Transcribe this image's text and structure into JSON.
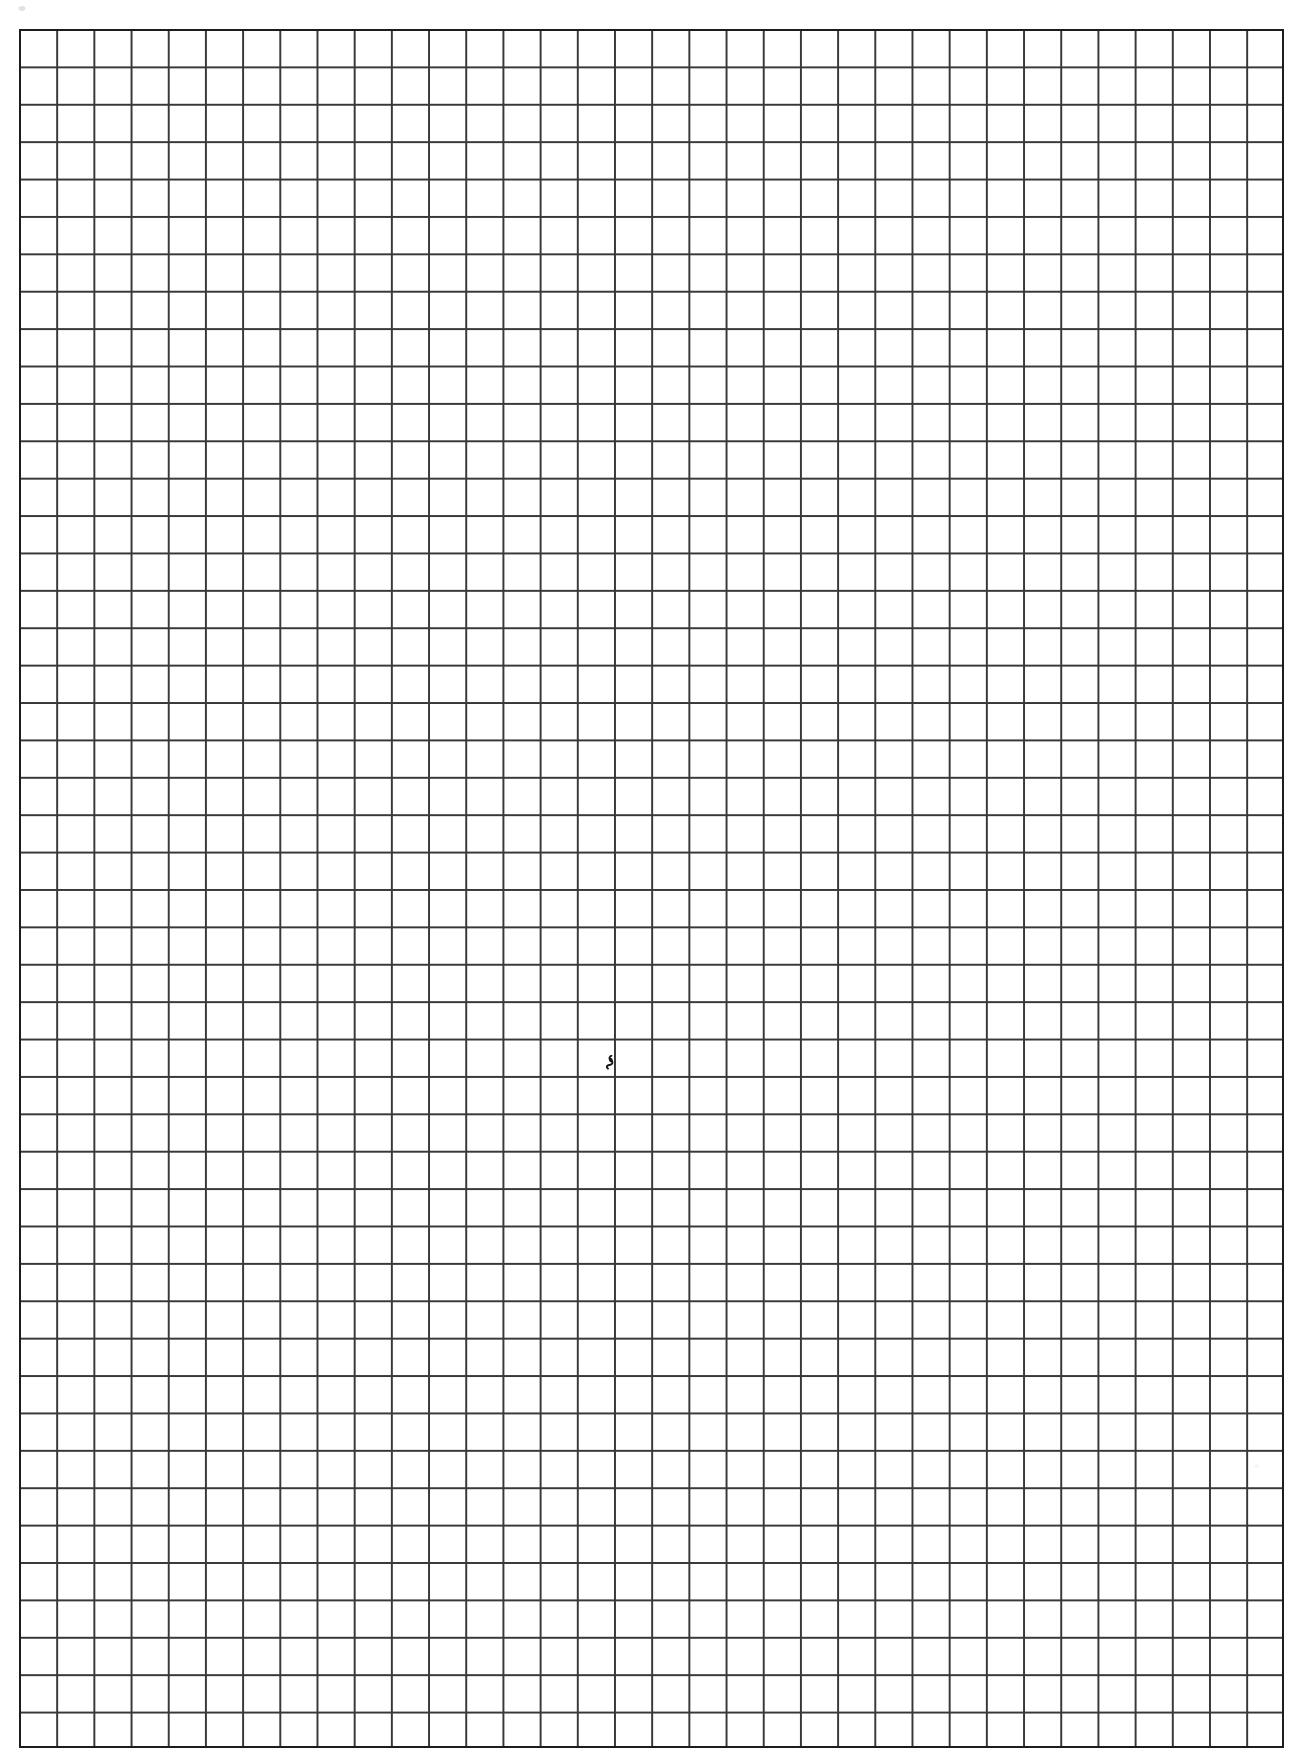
{
  "document": {
    "type": "scanned-grid-paper",
    "title": "Blank grid paper scan",
    "caption": "",
    "page_width_px": 1300,
    "page_height_px": 1753,
    "background_color": "#ffffff",
    "content_text": ""
  },
  "grid": {
    "name": "graph-paper-grid",
    "left_px": 19,
    "top_px": 29,
    "right_px": 1284,
    "bottom_px": 1748,
    "width_px": 1265,
    "height_px": 1719,
    "cell_width_px": 37.2,
    "cell_height_px": 37.4,
    "columns": 34,
    "rows": 46,
    "line_color": "#2a2a2a",
    "line_width_px": 1.6,
    "border_color": "#1d1d1d",
    "border_width_px": 2.2,
    "cell_fill_color": "#ffffff"
  },
  "marks": [
    {
      "name": "center-ink-mark",
      "description": "small handwritten ink squiggle near page center",
      "x_px": 610,
      "y_px": 1062,
      "color": "#141414"
    },
    {
      "name": "corner-speck",
      "description": "faint gray speck above top-left grid corner",
      "x_px": 22,
      "y_px": 8,
      "color": "#b9b9b9"
    },
    {
      "name": "edge-speck-right",
      "description": "very faint speck near right margin",
      "x_px": 1256,
      "y_px": 1466,
      "color": "#cfcfcf"
    }
  ]
}
